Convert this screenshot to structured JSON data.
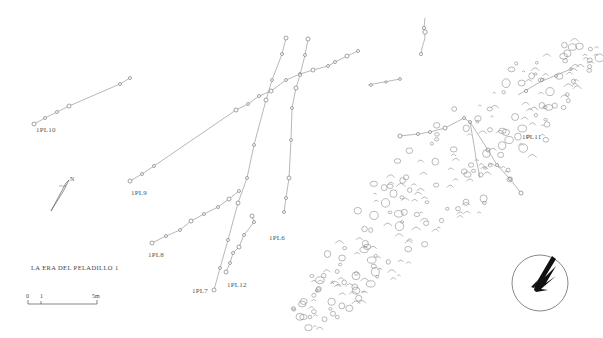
{
  "title": "LA ERA DEL PELADILLO 1",
  "north_label": "N",
  "scale": {
    "labels": [
      "0",
      "1",
      "5m"
    ]
  },
  "trackways": [
    {
      "id": "1PL10",
      "label": "1PL10",
      "label_pos": [
        36,
        132
      ],
      "points": [
        [
          34,
          124
        ],
        [
          45,
          118
        ],
        [
          57,
          112
        ],
        [
          69,
          106
        ],
        [
          120,
          84
        ],
        [
          130,
          78
        ]
      ]
    },
    {
      "id": "1PL9",
      "label": "1PL9",
      "label_pos": [
        131,
        196
      ],
      "points": [
        [
          130,
          181
        ],
        [
          142,
          174
        ],
        [
          154,
          166
        ],
        [
          236,
          110
        ],
        [
          248,
          104
        ],
        [
          259,
          96
        ],
        [
          271,
          91
        ],
        [
          286,
          80
        ],
        [
          300,
          74
        ],
        [
          313,
          70
        ],
        [
          328,
          66
        ],
        [
          335,
          62
        ],
        [
          347,
          56
        ],
        [
          358,
          51
        ]
      ]
    },
    {
      "id": "1PL8",
      "label": "1PL8",
      "label_pos": [
        148,
        258
      ],
      "points": [
        [
          152,
          243
        ],
        [
          166,
          236
        ],
        [
          180,
          230
        ],
        [
          191,
          221
        ],
        [
          204,
          214
        ],
        [
          218,
          207
        ],
        [
          229,
          199
        ],
        [
          239,
          191
        ]
      ]
    },
    {
      "id": "1PL7",
      "label": "1PL7",
      "label_pos": [
        193,
        291
      ],
      "points": [
        [
          286,
          38
        ],
        [
          282,
          54
        ],
        [
          272,
          80
        ],
        [
          266,
          100
        ],
        [
          254,
          145
        ],
        [
          247,
          178
        ],
        [
          238,
          203
        ],
        [
          228,
          240
        ],
        [
          220,
          268
        ],
        [
          214,
          290
        ]
      ]
    },
    {
      "id": "1PL6",
      "label": "1PL6",
      "label_pos": [
        270,
        237
      ],
      "points": [
        [
          308,
          39
        ],
        [
          305,
          55
        ],
        [
          300,
          75
        ],
        [
          296,
          88
        ],
        [
          292,
          108
        ],
        [
          291,
          140
        ],
        [
          289,
          178
        ],
        [
          286,
          198
        ],
        [
          284,
          212
        ]
      ]
    },
    {
      "id": "1PL12",
      "label": "1PL12",
      "label_pos": [
        228,
        285
      ],
      "points": [
        [
          252,
          216
        ],
        [
          254,
          222
        ],
        [
          244,
          235
        ],
        [
          239,
          247
        ],
        [
          233,
          253
        ],
        [
          230,
          263
        ],
        [
          226,
          272
        ]
      ]
    },
    {
      "id": "1PL11",
      "label": "1PL11",
      "label_pos": [
        521,
        138
      ],
      "points": [
        [
          400,
          136
        ],
        [
          418,
          134
        ],
        [
          430,
          132
        ],
        [
          445,
          128
        ],
        [
          464,
          118
        ],
        [
          470,
          122
        ],
        [
          488,
          150
        ],
        [
          497,
          165
        ],
        [
          510,
          179
        ],
        [
          521,
          193
        ]
      ]
    }
  ],
  "rose_diagram": {
    "cx": 540,
    "cy": 283,
    "r": 28
  }
}
